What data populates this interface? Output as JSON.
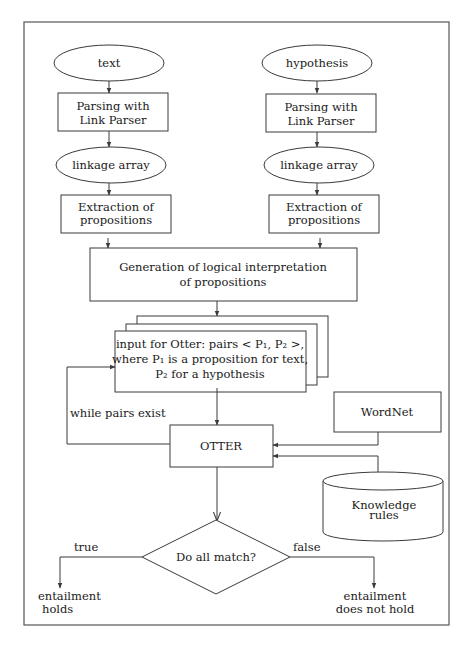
{
  "diagram": {
    "title": "",
    "nodes": {
      "text_input": {
        "label": "text",
        "shape": "ellipse"
      },
      "hyp_input": {
        "label": "hypothesis",
        "shape": "ellipse"
      },
      "parse_text": {
        "line1": "Parsing with",
        "line2": "Link Parser",
        "shape": "rect"
      },
      "parse_hyp": {
        "line1": "Parsing with",
        "line2": "Link Parser",
        "shape": "rect"
      },
      "linkage_text": {
        "label": "linkage array",
        "shape": "ellipse"
      },
      "linkage_hyp": {
        "label": "linkage array",
        "shape": "ellipse"
      },
      "extract_text": {
        "line1": "Extraction of",
        "line2": "propositions",
        "shape": "rect"
      },
      "extract_hyp": {
        "line1": "Extraction of",
        "line2": "propositions",
        "shape": "rect"
      },
      "generation": {
        "line1": "Generation of logical interpretation",
        "line2": "of propositions",
        "shape": "rect"
      },
      "otter_input": {
        "line1": "input for Otter: pairs < P₁, P₂ >,",
        "line2": "where P₁ is a proposition for text,",
        "line3": "P₂ for a hypothesis",
        "shape": "stacked-documents"
      },
      "otter": {
        "label": "OTTER",
        "shape": "rect"
      },
      "wordnet": {
        "label": "WordNet",
        "shape": "rect"
      },
      "knowledge": {
        "line1": "Knowledge",
        "line2": "rules",
        "shape": "cylinder"
      },
      "decision": {
        "label": "Do all match?",
        "shape": "diamond"
      },
      "holds": {
        "line1": "entailment",
        "line2": "holds",
        "shape": "terminal-text"
      },
      "not_holds": {
        "line1": "entailment",
        "line2": "does not hold",
        "shape": "terminal-text"
      }
    },
    "edge_labels": {
      "loop": "while pairs exist",
      "true": "true",
      "false": "false"
    },
    "edges": [
      [
        "text_input",
        "parse_text"
      ],
      [
        "parse_text",
        "linkage_text"
      ],
      [
        "linkage_text",
        "extract_text"
      ],
      [
        "extract_text",
        "generation"
      ],
      [
        "hyp_input",
        "parse_hyp"
      ],
      [
        "parse_hyp",
        "linkage_hyp"
      ],
      [
        "linkage_hyp",
        "extract_hyp"
      ],
      [
        "extract_hyp",
        "generation"
      ],
      [
        "generation",
        "otter_input"
      ],
      [
        "otter_input",
        "otter"
      ],
      [
        "otter",
        "otter_input",
        "while pairs exist"
      ],
      [
        "wordnet",
        "otter"
      ],
      [
        "knowledge",
        "otter"
      ],
      [
        "otter",
        "decision"
      ],
      [
        "decision",
        "holds",
        "true"
      ],
      [
        "decision",
        "not_holds",
        "false"
      ]
    ]
  }
}
